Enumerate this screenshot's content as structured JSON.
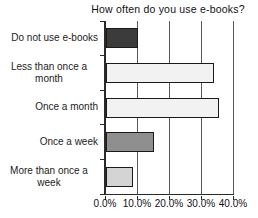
{
  "chart_data": {
    "type": "bar",
    "orientation": "horizontal",
    "title": "How often do you use e-books?",
    "categories": [
      "Do not use e-books",
      "Less than once a month",
      "Once a month",
      "Once a week",
      "More than once a week"
    ],
    "values": [
      10.0,
      34.0,
      35.5,
      15.0,
      8.5
    ],
    "value_unit": "%",
    "xlabel": "",
    "ylabel": "",
    "xlim": [
      0,
      40
    ],
    "x_tick_labels": [
      "0.0%",
      "10.0%",
      "20.0%",
      "30.0%",
      "40.0%"
    ],
    "grid": true,
    "legend": null,
    "bar_colors": [
      "#3b3b3b",
      "#f2f2f2",
      "#f2f2f2",
      "#8f8f8f",
      "#d4d4d4"
    ],
    "bar_border_color": "#1a1a1a",
    "axis_color": "#2a2a2a",
    "gridline_color": "#5a5a5a"
  }
}
